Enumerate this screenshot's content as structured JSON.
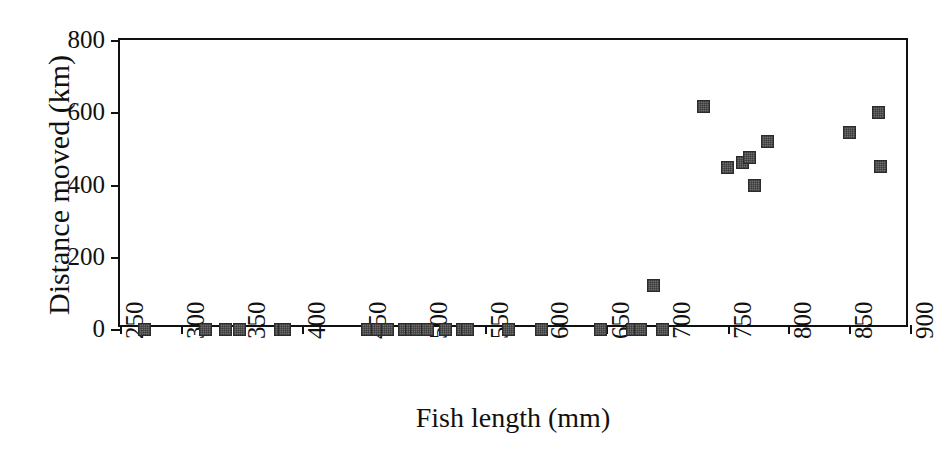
{
  "chart_data": {
    "type": "scatter",
    "title": "",
    "xlabel": "Fish length (mm)",
    "ylabel": "Distance moved (km)",
    "xlim": [
      250,
      900
    ],
    "ylim": [
      0,
      800
    ],
    "xticks": [
      250,
      300,
      350,
      400,
      450,
      500,
      550,
      600,
      650,
      700,
      750,
      800,
      850,
      900
    ],
    "xtick_labels": [
      "250",
      "300",
      "350",
      "400",
      "450",
      "500",
      "550",
      "600",
      "650",
      "700",
      "750",
      "800",
      "850",
      "900"
    ],
    "yticks": [
      0,
      200,
      400,
      600,
      800
    ],
    "ytick_labels": [
      "0",
      "200",
      "400",
      "600",
      "800"
    ],
    "grid": false,
    "legend": null,
    "marker": {
      "shape": "square",
      "fill_color": "#6e6e6e",
      "edge_color": "#2b2b2b",
      "size_px": 13
    },
    "points": [
      {
        "x": 270,
        "y": 0
      },
      {
        "x": 320,
        "y": 0
      },
      {
        "x": 337,
        "y": 0
      },
      {
        "x": 348,
        "y": 0
      },
      {
        "x": 382,
        "y": 0
      },
      {
        "x": 385,
        "y": 0
      },
      {
        "x": 454,
        "y": 0
      },
      {
        "x": 462,
        "y": 0
      },
      {
        "x": 470,
        "y": 0
      },
      {
        "x": 484,
        "y": 0
      },
      {
        "x": 490,
        "y": 0
      },
      {
        "x": 494,
        "y": 0
      },
      {
        "x": 503,
        "y": 0
      },
      {
        "x": 518,
        "y": 0
      },
      {
        "x": 532,
        "y": 0
      },
      {
        "x": 536,
        "y": 0
      },
      {
        "x": 570,
        "y": 0
      },
      {
        "x": 597,
        "y": 0
      },
      {
        "x": 645,
        "y": 0
      },
      {
        "x": 672,
        "y": 0
      },
      {
        "x": 678,
        "y": 0
      },
      {
        "x": 696,
        "y": 0
      },
      {
        "x": 689,
        "y": 120
      },
      {
        "x": 730,
        "y": 615
      },
      {
        "x": 750,
        "y": 448
      },
      {
        "x": 762,
        "y": 462
      },
      {
        "x": 768,
        "y": 475
      },
      {
        "x": 772,
        "y": 398
      },
      {
        "x": 783,
        "y": 518
      },
      {
        "x": 850,
        "y": 545
      },
      {
        "x": 874,
        "y": 600
      },
      {
        "x": 876,
        "y": 450
      }
    ]
  }
}
